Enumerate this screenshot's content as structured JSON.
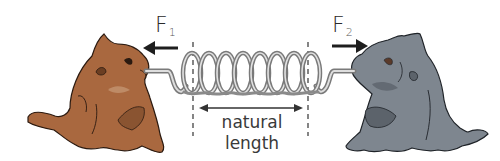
{
  "diagram": {
    "forces": [
      {
        "id": "F1",
        "symbol": "F",
        "subscript": "1",
        "direction": "left"
      },
      {
        "id": "F2",
        "symbol": "F",
        "subscript": "2",
        "direction": "right"
      }
    ],
    "natural_length_label": {
      "line1": "natural",
      "line2": "length"
    },
    "spring": {
      "coils": 8,
      "color": "#9a9a9a"
    },
    "cats": [
      {
        "position": "left",
        "fill": "#a9683f",
        "outline": "#2b1a10"
      },
      {
        "position": "right",
        "fill": "#7e868f",
        "outline": "#1f2328"
      }
    ],
    "colors": {
      "arrow": "#1e1e1e",
      "dash": "#444444",
      "background": "#ffffff"
    }
  }
}
